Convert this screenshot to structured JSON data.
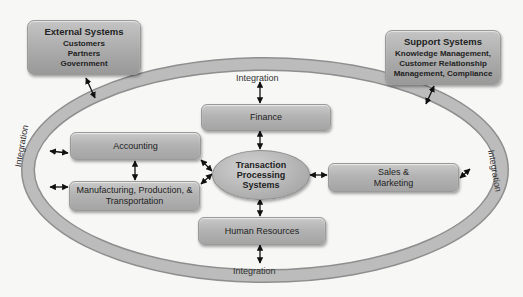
{
  "external_systems": {
    "title": "External Systems",
    "items": [
      "Customers",
      "Partners",
      "Government"
    ]
  },
  "support_systems": {
    "title": "Support Systems",
    "items": [
      "Knowledge Management,",
      "Customer Relationship",
      "Management, Compliance"
    ]
  },
  "ring": {
    "label_top": "Integration",
    "label_bottom": "Integration",
    "label_left": "Integration",
    "label_right": "Integration"
  },
  "center": {
    "lines": [
      "Transaction",
      "Processing",
      "Systems"
    ]
  },
  "modules": {
    "finance": "Finance",
    "accounting": "Accounting",
    "manufacturing": [
      "Manufacturing, Production, &",
      "Transportation"
    ],
    "sales": [
      "Sales &",
      "Marketing"
    ],
    "human_resources": "Human Resources"
  },
  "colors": {
    "background": "#f7f7f6",
    "ring": "#b8b8b8",
    "box": "#b3b3b3",
    "arrow": "#111111"
  }
}
